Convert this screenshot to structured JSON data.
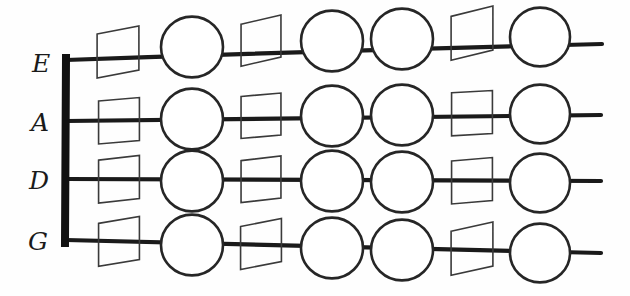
{
  "diagram": {
    "background_color": "#fefefe",
    "ink_color": "#1a1a1a",
    "node_fill": "#ffffff",
    "square_stroke": "#3a3a3a",
    "nut": {
      "label": "nut-bar",
      "x": 66,
      "y_top": 58,
      "y_bottom": 243,
      "stroke_width": 8
    },
    "strings": [
      {
        "label": "E",
        "index": 0,
        "label_x": 41,
        "label_y": 72,
        "y_start": 60,
        "y_end": 44,
        "x_start": 66,
        "x_end": 602,
        "nodes": [
          {
            "kind": "square",
            "cx": 118,
            "cy": 55,
            "size": 44,
            "skew": -7
          },
          {
            "kind": "circle",
            "cx": 192,
            "cy": 47,
            "r": 31
          },
          {
            "kind": "square",
            "cx": 261,
            "cy": 44,
            "size": 42,
            "skew": -8
          },
          {
            "kind": "circle",
            "cx": 332,
            "cy": 41,
            "r": 31
          },
          {
            "kind": "circle",
            "cx": 402,
            "cy": 39,
            "r": 31
          },
          {
            "kind": "square",
            "cx": 472,
            "cy": 37,
            "size": 44,
            "skew": -9
          },
          {
            "kind": "circle",
            "cx": 540,
            "cy": 37,
            "r": 30
          }
        ]
      },
      {
        "label": "A",
        "index": 1,
        "label_x": 40,
        "label_y": 131,
        "y_start": 121,
        "y_end": 115,
        "x_start": 66,
        "x_end": 601,
        "nodes": [
          {
            "kind": "square",
            "cx": 119,
            "cy": 122,
            "size": 43,
            "skew": -3
          },
          {
            "kind": "circle",
            "cx": 192,
            "cy": 119,
            "r": 31
          },
          {
            "kind": "square",
            "cx": 261,
            "cy": 117,
            "size": 42,
            "skew": -3
          },
          {
            "kind": "circle",
            "cx": 332,
            "cy": 116,
            "r": 31
          },
          {
            "kind": "circle",
            "cx": 402,
            "cy": 115,
            "r": 31
          },
          {
            "kind": "square",
            "cx": 472,
            "cy": 114,
            "size": 43,
            "skew": -2
          },
          {
            "kind": "circle",
            "cx": 540,
            "cy": 114,
            "r": 30
          }
        ]
      },
      {
        "label": "D",
        "index": 2,
        "label_x": 39,
        "label_y": 189,
        "y_start": 179,
        "y_end": 181,
        "x_start": 66,
        "x_end": 601,
        "nodes": [
          {
            "kind": "square",
            "cx": 119,
            "cy": 181,
            "size": 43,
            "skew": -4
          },
          {
            "kind": "circle",
            "cx": 192,
            "cy": 181,
            "r": 31
          },
          {
            "kind": "square",
            "cx": 261,
            "cy": 181,
            "size": 42,
            "skew": -4
          },
          {
            "kind": "circle",
            "cx": 332,
            "cy": 181,
            "r": 31
          },
          {
            "kind": "circle",
            "cx": 402,
            "cy": 182,
            "r": 31
          },
          {
            "kind": "square",
            "cx": 472,
            "cy": 182,
            "size": 43,
            "skew": -3
          },
          {
            "kind": "circle",
            "cx": 540,
            "cy": 183,
            "r": 30
          }
        ]
      },
      {
        "label": "G",
        "index": 3,
        "label_x": 38,
        "label_y": 250,
        "y_start": 240,
        "y_end": 253,
        "x_start": 66,
        "x_end": 601,
        "nodes": [
          {
            "kind": "square",
            "cx": 119,
            "cy": 244,
            "size": 43,
            "skew": -6
          },
          {
            "kind": "circle",
            "cx": 192,
            "cy": 245,
            "r": 31
          },
          {
            "kind": "square",
            "cx": 261,
            "cy": 247,
            "size": 43,
            "skew": -7
          },
          {
            "kind": "circle",
            "cx": 332,
            "cy": 248,
            "r": 31
          },
          {
            "kind": "circle",
            "cx": 402,
            "cy": 250,
            "r": 31
          },
          {
            "kind": "square",
            "cx": 472,
            "cy": 252,
            "size": 44,
            "skew": -8
          },
          {
            "kind": "circle",
            "cx": 540,
            "cy": 253,
            "r": 30
          }
        ]
      }
    ]
  }
}
